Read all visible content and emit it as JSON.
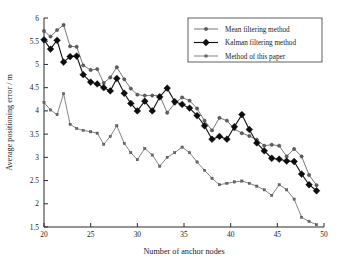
{
  "chart_data": {
    "type": "line",
    "title": "",
    "xlabel": "Number of anchor nodes",
    "ylabel": "Average positioning error / m",
    "xlim": [
      20,
      50
    ],
    "ylim": [
      1.5,
      6
    ],
    "xticks": [
      20,
      25,
      30,
      35,
      40,
      45,
      50
    ],
    "xtick_labels": [
      "20",
      "25",
      "30",
      "35",
      "40",
      "45",
      "50"
    ],
    "yticks": [
      1.5,
      2,
      2.5,
      3,
      3.5,
      4,
      4.5,
      5,
      5.5,
      6
    ],
    "ytick_labels": [
      "1.5",
      "2",
      "2.5",
      "3",
      "3.5",
      "4",
      "4.5",
      "5",
      "5.5",
      "6"
    ],
    "grid": false,
    "legend_position": "top-right",
    "x": [
      20,
      20.7,
      21.4,
      22.1,
      22.8,
      23.5,
      24.2,
      25,
      25.7,
      26.4,
      27.1,
      27.8,
      28.6,
      29.3,
      30,
      30.8,
      31.6,
      32.4,
      33.2,
      34,
      34.8,
      35.6,
      36.4,
      37.2,
      38,
      38.8,
      39.6,
      40.4,
      41.2,
      42,
      42.8,
      43.6,
      44.4,
      45.2,
      46,
      46.8,
      47.6,
      48.4,
      49.2
    ],
    "series": [
      {
        "name": "Mean filtering method",
        "marker": "circle",
        "color": "#5e5e5e",
        "values": [
          5.72,
          5.6,
          5.74,
          5.85,
          5.39,
          5.38,
          4.98,
          4.88,
          4.9,
          4.6,
          4.72,
          4.94,
          4.68,
          4.48,
          4.35,
          4.33,
          4.33,
          4.33,
          3.96,
          4.16,
          4.29,
          4.22,
          4.05,
          3.79,
          3.58,
          3.85,
          3.79,
          3.61,
          3.52,
          3.46,
          3.38,
          3.25,
          3.27,
          3.25,
          3.02,
          3.18,
          3.02,
          2.62,
          2.4
        ]
      },
      {
        "name": "Kalman filtering method",
        "marker": "diamond",
        "color": "#0d0d0d",
        "values": [
          5.53,
          5.33,
          5.52,
          5.05,
          5.17,
          5.18,
          4.78,
          4.62,
          4.58,
          4.5,
          4.43,
          4.7,
          4.38,
          4.16,
          4.0,
          4.21,
          4.0,
          4.3,
          4.49,
          4.2,
          4.14,
          4.06,
          3.9,
          3.68,
          3.39,
          3.45,
          3.39,
          3.66,
          3.92,
          3.6,
          3.31,
          3.14,
          2.98,
          2.96,
          2.92,
          2.91,
          2.64,
          2.41,
          2.28
        ]
      },
      {
        "name": "Method of this paper",
        "marker": "square",
        "color": "#6a6a6a",
        "values": [
          4.18,
          4.02,
          3.92,
          4.37,
          3.71,
          3.62,
          3.58,
          3.55,
          3.52,
          3.28,
          3.45,
          3.68,
          3.3,
          3.1,
          2.95,
          3.19,
          3.05,
          2.81,
          3.0,
          3.1,
          3.22,
          3.1,
          2.9,
          2.72,
          2.55,
          2.41,
          2.44,
          2.47,
          2.49,
          2.44,
          2.38,
          2.3,
          2.18,
          2.41,
          2.3,
          2.1,
          1.71,
          1.62,
          1.55
        ]
      }
    ]
  },
  "legend": {
    "items": [
      {
        "label": "Mean filtering method",
        "marker": "circle"
      },
      {
        "label": "Kalman filtering method",
        "marker": "diamond"
      },
      {
        "label": "Method of this paper",
        "marker": "square"
      }
    ]
  }
}
